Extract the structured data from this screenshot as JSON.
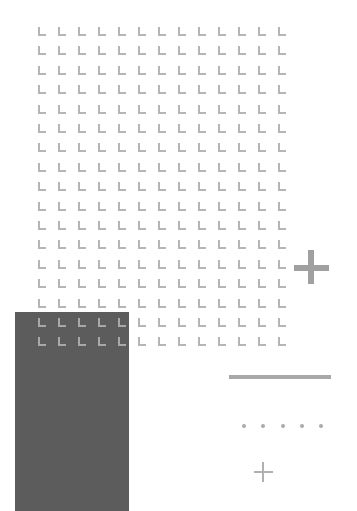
{
  "canvas": {
    "width": 357,
    "height": 511,
    "background": "#ffffff"
  },
  "grid": {
    "shape": "l-corner-mark",
    "columns": 13,
    "rows": 17,
    "origin_x": 38,
    "origin_y": 27,
    "col_spacing": 20,
    "row_spacing": 19.4,
    "color": "#b5b5b5"
  },
  "dark_panel": {
    "color": "#5c5c5c",
    "x": 15,
    "y": 312,
    "width": 114,
    "height": 199
  },
  "shapes": {
    "big_plus": {
      "icon": "plus-icon",
      "color": "#a0a0a0"
    },
    "horizontal_line": {
      "color": "#a8a8a8"
    },
    "dots": {
      "count": 5,
      "xs": [
        244,
        263,
        283,
        302,
        321
      ],
      "y": 426,
      "color": "#ababab"
    },
    "small_plus": {
      "icon": "plus-icon",
      "color": "#b0b0b0"
    }
  }
}
